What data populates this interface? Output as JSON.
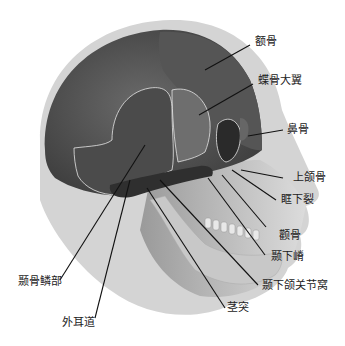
{
  "figure": {
    "title": "",
    "colors": {
      "head_outline": "#d2d2d2",
      "cranium_dark": "#4a4a4a",
      "cranium_mid": "#5f5f5f",
      "bone_outline": "#e6e6e6",
      "face_light": "#bdbdbd",
      "leader_line": "#111111",
      "label_text": "#222222"
    }
  },
  "labels": [
    {
      "id": "frontal",
      "text": "额骨"
    },
    {
      "id": "greater-wing-sphenoid",
      "text": "蝶骨大翼"
    },
    {
      "id": "nasal",
      "text": "鼻骨"
    },
    {
      "id": "maxilla",
      "text": "上颌骨"
    },
    {
      "id": "inferior-orbital-fissure",
      "text": "眶下裂"
    },
    {
      "id": "zygomatic",
      "text": "颧骨"
    },
    {
      "id": "infratemporal-crest",
      "text": "颞下嵴"
    },
    {
      "id": "mandibular-fossa",
      "text": "颞下颌关节窝"
    },
    {
      "id": "styloid-process",
      "text": "茎突"
    },
    {
      "id": "squamous-temporal",
      "text": "颞骨鳞部"
    },
    {
      "id": "external-acoustic-meatus",
      "text": "外耳道"
    }
  ]
}
